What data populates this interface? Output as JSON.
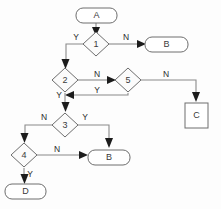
{
  "diagram": {
    "background_color": "#fdfdfd",
    "line_color": "#8a8a8a",
    "arrow_color": "#1c1c1c",
    "node_stroke_color": "#6e6e6e",
    "node_fill_color": "#ffffff",
    "text_color": "#3a3a3a"
  },
  "nodes": {
    "a": {
      "label": "A",
      "shape": "rounded-rectangle",
      "x": 96,
      "y": 15
    },
    "d1": {
      "label": "1",
      "shape": "diamond",
      "x": 96,
      "y": 44
    },
    "b_top": {
      "label": "B",
      "shape": "rounded-rectangle",
      "x": 166,
      "y": 44
    },
    "d2": {
      "label": "2",
      "shape": "diamond",
      "x": 65,
      "y": 80
    },
    "d5": {
      "label": "5",
      "shape": "diamond",
      "x": 128,
      "y": 80
    },
    "c": {
      "label": "C",
      "shape": "rectangle",
      "x": 196,
      "y": 116
    },
    "d3": {
      "label": "3",
      "shape": "diamond",
      "x": 65,
      "y": 125
    },
    "d4": {
      "label": "4",
      "shape": "diamond",
      "x": 24,
      "y": 155
    },
    "b_bottom": {
      "label": "B",
      "shape": "rounded-rectangle",
      "x": 109,
      "y": 157
    },
    "d": {
      "label": "D",
      "shape": "rounded-rectangle",
      "x": 25,
      "y": 191
    }
  },
  "edges": [
    {
      "id": "a-to-1",
      "from": "a",
      "to": "d1",
      "label": ""
    },
    {
      "id": "1-yes",
      "from": "d1",
      "to": "d2",
      "label": "Y",
      "label_x": 76,
      "label_y": 38
    },
    {
      "id": "1-no",
      "from": "d1",
      "to": "b_top",
      "label": "N",
      "label_x": 126,
      "label_y": 38
    },
    {
      "id": "2-no",
      "from": "d2",
      "to": "d5",
      "label": "N",
      "label_x": 97,
      "label_y": 75
    },
    {
      "id": "5-yes",
      "from": "d5",
      "to": "d3",
      "label": "Y",
      "label_x": 97,
      "label_y": 91
    },
    {
      "id": "2-yes",
      "from": "d2",
      "to": "d3",
      "label": "Y",
      "label_x": 59,
      "label_y": 96
    },
    {
      "id": "5-no",
      "from": "d5",
      "to": "c",
      "label": "N",
      "label_x": 166,
      "label_y": 75
    },
    {
      "id": "3-no",
      "from": "d3",
      "to": "d4",
      "label": "N",
      "label_x": 44,
      "label_y": 118
    },
    {
      "id": "3-yes",
      "from": "d3",
      "to": "b_bottom",
      "label": "Y",
      "label_x": 85,
      "label_y": 118
    },
    {
      "id": "4-no",
      "from": "d4",
      "to": "b_bottom",
      "label": "N",
      "label_x": 57,
      "label_y": 150
    },
    {
      "id": "4-yes",
      "from": "d4",
      "to": "d",
      "label": "Y",
      "label_x": 30,
      "label_y": 175
    }
  ]
}
